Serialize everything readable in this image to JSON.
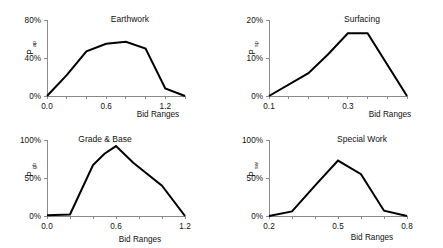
{
  "figure": {
    "panel_count": 4
  },
  "chart_data": [
    {
      "type": "line",
      "title": "Earthwork",
      "xlabel": "Bid Ranges",
      "ylabel": "P",
      "ylabel_sub": "ap",
      "xlim": [
        0.0,
        1.4
      ],
      "ylim": [
        0,
        80
      ],
      "xticks": [
        0.0,
        0.2,
        0.4,
        0.6,
        0.8,
        1.0,
        1.2,
        1.4
      ],
      "xticklabels": [
        "0.0",
        "",
        "",
        "0.6",
        "",
        "",
        "1.2",
        ""
      ],
      "yticks": [
        0,
        40,
        80
      ],
      "yticklabels": [
        "0%",
        "40%",
        "80%"
      ],
      "grid": false,
      "legend": "none",
      "x": [
        0.0,
        0.2,
        0.4,
        0.6,
        0.8,
        1.0,
        1.2,
        1.4
      ],
      "values": [
        0,
        22,
        47,
        55,
        57,
        50,
        8,
        0
      ]
    },
    {
      "type": "line",
      "title": "Surfacing",
      "xlabel": "Bid Ranges",
      "ylabel": "P",
      "ylabel_sub": "sp",
      "xlim": [
        0.1,
        0.45
      ],
      "ylim": [
        0,
        20
      ],
      "xticks": [
        0.1,
        0.15,
        0.2,
        0.25,
        0.3,
        0.35,
        0.4,
        0.45
      ],
      "xticklabels": [
        "0.1",
        "",
        "",
        "",
        "0.3",
        "",
        "",
        ""
      ],
      "yticks": [
        0,
        10,
        20
      ],
      "yticklabels": [
        "0%",
        "10%",
        "20%"
      ],
      "grid": false,
      "legend": "none",
      "x": [
        0.1,
        0.2,
        0.25,
        0.3,
        0.35,
        0.45
      ],
      "values": [
        0,
        6,
        11,
        16.5,
        16.5,
        0
      ]
    },
    {
      "type": "line",
      "title": "Grade & Base",
      "xlabel": "Bid Ranges",
      "ylabel": "P",
      "ylabel_sub": "gb",
      "xlim": [
        0.0,
        1.2
      ],
      "ylim": [
        0,
        100
      ],
      "xticks": [
        0.0,
        0.2,
        0.4,
        0.6,
        0.8,
        1.0,
        1.2
      ],
      "xticklabels": [
        "0.0",
        "",
        "",
        "0.6",
        "",
        "",
        "1.2"
      ],
      "yticks": [
        0,
        50,
        100
      ],
      "yticklabels": [
        "0%",
        "50%",
        "100%"
      ],
      "grid": false,
      "legend": "none",
      "x": [
        0.0,
        0.2,
        0.4,
        0.5,
        0.6,
        0.75,
        1.0,
        1.2
      ],
      "values": [
        1,
        2,
        67,
        82,
        92,
        70,
        40,
        0
      ]
    },
    {
      "type": "line",
      "title": "Special Work",
      "xlabel": "Bid Ranges",
      "ylabel": "P",
      "ylabel_sub": "sw",
      "xlim": [
        0.2,
        0.8
      ],
      "ylim": [
        0,
        100
      ],
      "xticks": [
        0.2,
        0.3,
        0.4,
        0.5,
        0.6,
        0.7,
        0.8
      ],
      "xticklabels": [
        "0.2",
        "",
        "",
        "0.5",
        "",
        "",
        "0.8"
      ],
      "yticks": [
        0,
        50,
        100
      ],
      "yticklabels": [
        "0%",
        "50%",
        "100%"
      ],
      "grid": false,
      "legend": "none",
      "x": [
        0.2,
        0.3,
        0.4,
        0.5,
        0.6,
        0.7,
        0.8
      ],
      "values": [
        0,
        6,
        40,
        73,
        55,
        7,
        0
      ]
    }
  ]
}
